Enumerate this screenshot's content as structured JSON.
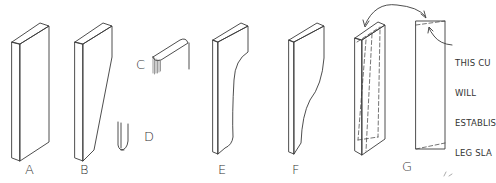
{
  "figure": {
    "stroke_color": "#3a3a3a",
    "background": "#ffffff",
    "parts": [
      {
        "id": "A",
        "label": "A",
        "description": "rectangular blank"
      },
      {
        "id": "B",
        "label": "B",
        "description": "tapered blank"
      },
      {
        "id": "C",
        "label": "C",
        "description": "top edge rounded profile"
      },
      {
        "id": "D",
        "label": "D",
        "description": "rounded end profile"
      },
      {
        "id": "E",
        "label": "E",
        "description": "curved cut leg"
      },
      {
        "id": "F",
        "label": "F",
        "description": "curved cut leg variant"
      },
      {
        "id": "G",
        "label": "G",
        "description": "blank with cut lines and flipped piece"
      }
    ],
    "annotation": {
      "lines": [
        "THIS CU",
        "WILL",
        "ESTABLIS",
        "LEG SLA"
      ]
    }
  }
}
